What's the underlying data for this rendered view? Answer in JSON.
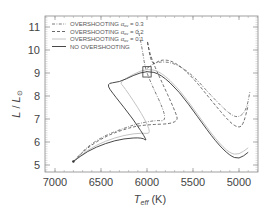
{
  "chart_data": {
    "type": "line",
    "title": "",
    "xlabel": "T_eff (K)",
    "xlabel_main": "T",
    "xlabel_sub": "eff",
    "xlabel_unit": " (K)",
    "ylabel": "L / L_sun",
    "xlim": [
      7100,
      4780
    ],
    "ylim": [
      4.7,
      11.5
    ],
    "x_reversed": true,
    "grid": false,
    "x_ticks": [
      7000,
      6500,
      6000,
      5500,
      5000
    ],
    "y_ticks": [
      5,
      6,
      7,
      8,
      9,
      10,
      11
    ],
    "legend_position": "upper-left",
    "legend": [
      {
        "label": "OVERSHOOTING α_ov = 0.3",
        "prefix": "OVERSHOOTING ",
        "alpha": "α",
        "sub": "ov",
        "suffix": " = 0.3",
        "style": "dash-dot",
        "color": "#555555"
      },
      {
        "label": "OVERSHOOTING α_ov = 0.2",
        "prefix": "OVERSHOOTING ",
        "alpha": "α",
        "sub": "ov",
        "suffix": " = 0.2",
        "style": "dashed",
        "color": "#444444"
      },
      {
        "label": "OVERSHOOTING α_ov = 0.1",
        "prefix": "OVERSHOOTING ",
        "alpha": "α",
        "sub": "ov",
        "suffix": " = 0.1",
        "style": "solid-light",
        "color": "#bbbbbb"
      },
      {
        "label": "NO OVERSHOOTING",
        "prefix": "NO OVERSHOOTING",
        "alpha": "",
        "sub": "",
        "suffix": "",
        "style": "solid",
        "color": "#333333"
      }
    ],
    "series": [
      {
        "name": "OVERSHOOTING α_ov = 0.3",
        "style": "dash-dot",
        "color": "#555555",
        "points": [
          [
            6800,
            5.15
          ],
          [
            6650,
            5.8
          ],
          [
            6450,
            6.3
          ],
          [
            6250,
            6.6
          ],
          [
            6100,
            6.8
          ],
          [
            5900,
            6.95
          ],
          [
            5800,
            6.9
          ],
          [
            5820,
            7.4
          ],
          [
            5950,
            8.5
          ],
          [
            6020,
            9.2
          ],
          [
            6050,
            10.0
          ],
          [
            6080,
            10.6
          ],
          [
            6100,
            10.9
          ]
        ]
      },
      {
        "name": "OVERSHOOTING α_ov = 0.2",
        "style": "dashed",
        "color": "#444444",
        "points": [
          [
            6800,
            5.15
          ],
          [
            6650,
            5.75
          ],
          [
            6450,
            6.25
          ],
          [
            6250,
            6.55
          ],
          [
            6050,
            6.75
          ],
          [
            5650,
            6.8
          ],
          [
            5700,
            7.4
          ],
          [
            5850,
            8.7
          ],
          [
            5950,
            9.6
          ],
          [
            5990,
            10.2
          ],
          [
            6000,
            10.5
          ],
          [
            5950,
            9.3
          ],
          [
            5850,
            9.6
          ],
          [
            5700,
            9.5
          ],
          [
            5500,
            8.8
          ],
          [
            5300,
            7.8
          ],
          [
            5100,
            6.85
          ],
          [
            5000,
            6.6
          ],
          [
            4950,
            6.8
          ],
          [
            4900,
            7.6
          ]
        ]
      },
      {
        "name": "OVERSHOOTING α_ov = 0.1",
        "style": "solid-light",
        "color": "#bbbbbb",
        "points": [
          [
            6800,
            5.15
          ],
          [
            6650,
            5.65
          ],
          [
            6450,
            6.05
          ],
          [
            6250,
            6.3
          ],
          [
            6050,
            6.4
          ],
          [
            5950,
            6.35
          ],
          [
            6050,
            7.2
          ],
          [
            6250,
            8.4
          ],
          [
            6300,
            8.6
          ],
          [
            6150,
            8.95
          ],
          [
            6000,
            9.2
          ],
          [
            5850,
            9.05
          ],
          [
            5650,
            8.3
          ],
          [
            5450,
            7.2
          ],
          [
            5250,
            6.1
          ],
          [
            5100,
            5.5
          ],
          [
            5000,
            5.45
          ],
          [
            4900,
            5.75
          ]
        ]
      },
      {
        "name": "NO OVERSHOOTING",
        "style": "solid",
        "color": "#333333",
        "points": [
          [
            6800,
            5.15
          ],
          [
            6650,
            5.6
          ],
          [
            6450,
            5.95
          ],
          [
            6250,
            6.15
          ],
          [
            6050,
            6.2
          ],
          [
            5990,
            6.0
          ],
          [
            6150,
            7.0
          ],
          [
            6350,
            8.0
          ],
          [
            6450,
            8.55
          ],
          [
            6300,
            8.6
          ],
          [
            6150,
            8.9
          ],
          [
            6000,
            9.1
          ],
          [
            5850,
            8.95
          ],
          [
            5650,
            8.2
          ],
          [
            5450,
            7.1
          ],
          [
            5250,
            6.0
          ],
          [
            5100,
            5.4
          ],
          [
            5000,
            5.25
          ],
          [
            4900,
            5.55
          ]
        ]
      },
      {
        "name": "OVERSHOOTING α_ov = 0.3 (post-MS)",
        "style": "dash-dot",
        "color": "#555555",
        "points": [
          [
            6000,
            9.2
          ],
          [
            5900,
            9.5
          ],
          [
            5700,
            9.45
          ],
          [
            5500,
            8.9
          ],
          [
            5300,
            8.0
          ],
          [
            5100,
            7.2
          ],
          [
            5000,
            7.05
          ],
          [
            4920,
            7.4
          ],
          [
            4880,
            8.2
          ]
        ]
      }
    ],
    "annotations": [
      {
        "type": "box",
        "center": [
          6000,
          9.05
        ],
        "width_K": 90,
        "height_L": 0.45
      }
    ]
  }
}
